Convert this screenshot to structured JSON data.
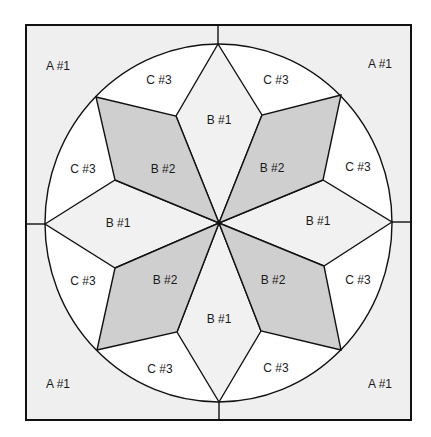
{
  "diagram": {
    "type": "quilt-block-pattern",
    "colors": {
      "background_A": "#efefef",
      "diamond_B1": "#f1f1f1",
      "diamond_B2": "#cfcfcf",
      "wedge_C3": "#ffffff",
      "outline": "#111111"
    },
    "pieces": {
      "A1": {
        "label": "A #1",
        "count": 4,
        "regions": [
          "top-left corner",
          "top-right corner",
          "bottom-left corner",
          "bottom-right corner"
        ]
      },
      "B1": {
        "label": "B #1",
        "count": 4,
        "regions": [
          "top",
          "right",
          "bottom",
          "left"
        ]
      },
      "B2": {
        "label": "B #2",
        "count": 4,
        "regions": [
          "upper-left",
          "upper-right",
          "lower-left",
          "lower-right"
        ]
      },
      "C3": {
        "label": "C #3",
        "count": 8
      }
    },
    "labels": {
      "a_tl": "A #1",
      "a_tr": "A #1",
      "a_bl": "A #1",
      "a_br": "A #1",
      "b1_top": "B #1",
      "b1_right": "B #1",
      "b1_bottom": "B #1",
      "b1_left": "B #1",
      "b2_ul": "B #2",
      "b2_ur": "B #2",
      "b2_ll": "B #2",
      "b2_lr": "B #2",
      "c3_top_left": "C #3",
      "c3_top_right": "C #3",
      "c3_right_top": "C #3",
      "c3_right_bottom": "C #3",
      "c3_bottom_right": "C #3",
      "c3_bottom_left": "C #3",
      "c3_left_bottom": "C #3",
      "c3_left_top": "C #3"
    }
  }
}
